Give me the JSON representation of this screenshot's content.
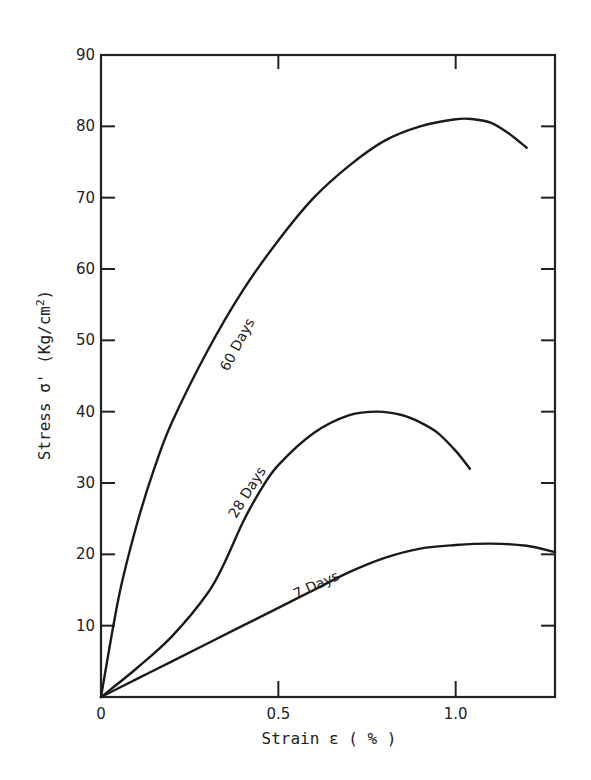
{
  "chart_data": {
    "type": "line",
    "title": "",
    "xlabel": "Strain ε ( % )",
    "ylabel": "Stress σ' (Kg/cm²)",
    "xlim": [
      0,
      1.28
    ],
    "ylim": [
      0,
      90
    ],
    "xticks": [
      0,
      0.5,
      1.0
    ],
    "xtick_labels": [
      "0",
      "0.5",
      "1.0"
    ],
    "yticks": [
      10,
      20,
      30,
      40,
      50,
      60,
      70,
      80,
      90
    ],
    "ytick_labels": [
      "10",
      "20",
      "30",
      "40",
      "50",
      "60",
      "70",
      "80",
      "90"
    ],
    "grid": false,
    "legend": "inline labels on curves",
    "series": [
      {
        "name": "60 Days",
        "x": [
          0,
          0.05,
          0.1,
          0.15,
          0.2,
          0.3,
          0.4,
          0.5,
          0.6,
          0.7,
          0.8,
          0.9,
          1.0,
          1.05,
          1.1,
          1.15,
          1.2
        ],
        "y": [
          0,
          14,
          24,
          32,
          38.5,
          48.5,
          57,
          64,
          70,
          74.5,
          78,
          80,
          81,
          81,
          80.5,
          79,
          77
        ]
      },
      {
        "name": "28 Days",
        "x": [
          0,
          0.1,
          0.2,
          0.3,
          0.35,
          0.4,
          0.45,
          0.5,
          0.6,
          0.7,
          0.78,
          0.85,
          0.9,
          0.95,
          1.0,
          1.04
        ],
        "y": [
          0,
          4,
          8.5,
          14.5,
          19,
          24.5,
          29,
          32.5,
          37,
          39.5,
          40,
          39.5,
          38.5,
          37,
          34.5,
          32
        ]
      },
      {
        "name": "7 Days",
        "x": [
          0,
          0.1,
          0.2,
          0.3,
          0.4,
          0.5,
          0.6,
          0.7,
          0.8,
          0.9,
          1.0,
          1.1,
          1.2,
          1.28
        ],
        "y": [
          0,
          2.5,
          5,
          7.5,
          10,
          12.5,
          15,
          17.5,
          19.5,
          20.8,
          21.3,
          21.5,
          21.2,
          20.3
        ]
      }
    ],
    "annotations": [
      "60 Days",
      "28 Days",
      "7 Days"
    ]
  },
  "labels": {
    "origin": "0",
    "x_title": "Strain ε ( % )",
    "y_title_main": "Stress σ' (Kg/cm",
    "y_title_sup": "2",
    "y_title_end": ")",
    "curve_60": "60 Days",
    "curve_28": "28 Days",
    "curve_7": "7 Days"
  }
}
